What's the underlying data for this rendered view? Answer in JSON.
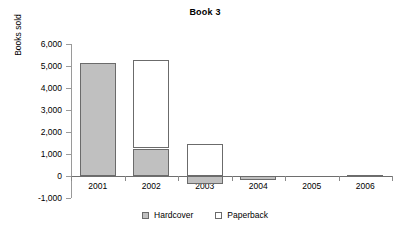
{
  "chart_data": {
    "type": "bar",
    "subtype": "stacked-column",
    "title": "Book 3",
    "xlabel": "",
    "ylabel": "Books sold",
    "categories": [
      "2001",
      "2002",
      "2003",
      "2004",
      "2005",
      "2006"
    ],
    "series": [
      {
        "name": "Hardcover",
        "color": "#c0c0c0",
        "values": [
          5130,
          1250,
          -370,
          -180,
          0,
          60
        ]
      },
      {
        "name": "Paperback",
        "color": "#ffffff",
        "values": [
          0,
          4020,
          1460,
          0,
          0,
          0
        ]
      }
    ],
    "ylim": [
      -1000,
      6000
    ],
    "ytick_labels": [
      "6,000",
      "5,000",
      "4,000",
      "3,000",
      "2,000",
      "1,000",
      "0",
      "-1,000"
    ],
    "ytick_values": [
      6000,
      5000,
      4000,
      3000,
      2000,
      1000,
      0,
      -1000
    ],
    "grid": false,
    "legend_position": "bottom"
  },
  "legend": {
    "items": [
      {
        "label": "Hardcover"
      },
      {
        "label": "Paperback"
      }
    ]
  }
}
